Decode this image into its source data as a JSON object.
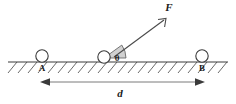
{
  "diagram": {
    "type": "physics-free-body-diagram",
    "canvas": {
      "width": 236,
      "height": 104,
      "background": "#ffffff"
    },
    "colors": {
      "stroke": "#3a3a3a",
      "hatch": "#5a5a5a",
      "wedge_fill": "#c9c9c9",
      "dimension": "#6b6b6b",
      "label": "#1a1a1a",
      "ball_fill": "#ffffff"
    },
    "ground": {
      "label": "hatched-surface",
      "y": 62,
      "x_start": 8,
      "x_end": 228,
      "hatch_count": 22,
      "hatch_depth": 11,
      "hatch_slant": "up-right"
    },
    "bodies": [
      {
        "id": "A",
        "label": "A",
        "cx": 42,
        "cy": 56,
        "r": 6,
        "label_x": 42,
        "label_y": 70
      },
      {
        "id": "mid",
        "label": "",
        "cx": 104,
        "cy": 57,
        "r": 6,
        "label_x": 0,
        "label_y": 0
      },
      {
        "id": "B",
        "label": "B",
        "cx": 202,
        "cy": 56,
        "r": 6,
        "label_x": 202,
        "label_y": 70
      }
    ],
    "force_vector": {
      "symbol": "F",
      "label_x": 169,
      "label_y": 11,
      "x1": 114,
      "y1": 57,
      "x2": 166,
      "y2": 19,
      "arrowhead": "open-tip"
    },
    "angle": {
      "symbol": "θ",
      "label_x": 117,
      "label_y": 60,
      "vertex_x": 104,
      "vertex_y": 58,
      "radius": 18,
      "start_deg": 0,
      "end_deg": 36
    },
    "dimension": {
      "symbol": "d",
      "label_x": 120,
      "label_y": 96,
      "y": 82,
      "x_start": 42,
      "x_end": 203,
      "style": "double-headed-arrow"
    }
  }
}
